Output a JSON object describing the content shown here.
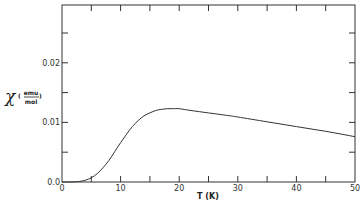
{
  "chart_data": {
    "type": "line",
    "title": "",
    "xlabel": "T (K)",
    "ylabel": "χ (emu/mol)",
    "ylabel_symbol": "χ",
    "ylabel_unit_num": "emu",
    "ylabel_unit_den": "mol",
    "xlim": [
      0,
      50
    ],
    "ylim": [
      0,
      0.0297
    ],
    "x_ticks": [
      0,
      10,
      20,
      30,
      40,
      50
    ],
    "x_tick_labels": [
      "0",
      "10",
      "20",
      "30",
      "40",
      "50"
    ],
    "x_minor_ticks": [
      5,
      15,
      25,
      35,
      45
    ],
    "y_ticks": [
      0.0,
      0.01,
      0.02
    ],
    "y_tick_labels": [
      "0.0",
      "0.01",
      "0.02"
    ],
    "y_minor_ticks": [
      0.005,
      0.015,
      0.025
    ],
    "grid": false,
    "legend": null,
    "series": [
      {
        "name": "χ(T)",
        "x": [
          0,
          2,
          3,
          4,
          5,
          6,
          7,
          8,
          9,
          10,
          11,
          12,
          13,
          14,
          15,
          16,
          17,
          18,
          19,
          20,
          22,
          25,
          28,
          30,
          35,
          40,
          45,
          50
        ],
        "values": [
          0.0,
          2e-05,
          0.0001,
          0.0003,
          0.0007,
          0.0014,
          0.0024,
          0.0036,
          0.0051,
          0.0066,
          0.008,
          0.0093,
          0.0103,
          0.0111,
          0.0116,
          0.012,
          0.0122,
          0.0123,
          0.0123,
          0.0123,
          0.012,
          0.0116,
          0.0112,
          0.0109,
          0.0101,
          0.0093,
          0.0085,
          0.0076
        ]
      }
    ]
  }
}
